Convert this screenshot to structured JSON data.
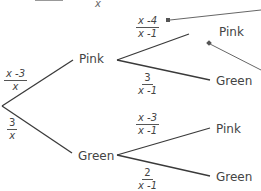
{
  "top_partial": {
    "left_text": "",
    "right_text": "x"
  },
  "tree": {
    "root": {
      "branches": [
        {
          "outcome": "Pink",
          "probability": {
            "numerator": "x -3",
            "denominator": "x"
          }
        },
        {
          "outcome": "Green",
          "probability": {
            "numerator": "3",
            "denominator": "x"
          }
        }
      ]
    },
    "pink_node": {
      "branches": [
        {
          "outcome": "Pink",
          "probability": {
            "numerator": "x -4",
            "denominator": "x -1"
          }
        },
        {
          "outcome": "Green",
          "probability": {
            "numerator": "3",
            "denominator": "x -1"
          }
        }
      ]
    },
    "green_node": {
      "branches": [
        {
          "outcome": "Pink",
          "probability": {
            "numerator": "x -3",
            "denominator": "x -1"
          }
        },
        {
          "outcome": "Green",
          "probability": {
            "numerator": "2",
            "denominator": "x -1"
          }
        }
      ]
    }
  },
  "colors": {
    "line": "#3a3a3a",
    "pointer": "#666666",
    "text": "#444444"
  }
}
